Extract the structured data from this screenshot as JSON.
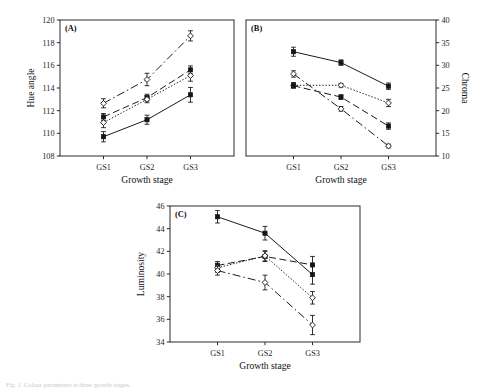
{
  "figure": {
    "caption": "Fig. 1. Colour parameters at three growth stages.",
    "panels": [
      "A",
      "B",
      "C"
    ]
  },
  "chart_data": [
    {
      "type": "line",
      "panel_tag": "(A)",
      "title": "",
      "xlabel": "Growth stage",
      "ylabel": "Hue angle",
      "ylabel_side": "left",
      "categories": [
        "GS1",
        "GS2",
        "GS3"
      ],
      "ylim": [
        108,
        120
      ],
      "yticks": [
        108,
        110,
        112,
        114,
        116,
        118,
        120
      ],
      "grid": false,
      "legend": "none",
      "series": [
        {
          "name": "S1",
          "marker": "filled-square",
          "linestyle": "solid",
          "values": [
            109.7,
            111.2,
            113.4
          ],
          "errors": [
            0.45,
            0.4,
            0.65
          ]
        },
        {
          "name": "S2",
          "marker": "filled-square",
          "linestyle": "dashed",
          "values": [
            111.45,
            113.15,
            115.6
          ],
          "errors": [
            0.3,
            0.3,
            0.35
          ]
        },
        {
          "name": "S3",
          "marker": "open-diamond",
          "linestyle": "dotted",
          "values": [
            110.95,
            113.0,
            115.1
          ],
          "errors": [
            0.45,
            0.3,
            0.5
          ]
        },
        {
          "name": "S4",
          "marker": "open-diamond",
          "linestyle": "dashdot",
          "values": [
            112.65,
            114.75,
            118.6
          ],
          "errors": [
            0.4,
            0.55,
            0.45
          ]
        }
      ]
    },
    {
      "type": "line",
      "panel_tag": "(B)",
      "title": "",
      "xlabel": "Growth stage",
      "ylabel": "Chroma",
      "ylabel_side": "right",
      "categories": [
        "GS1",
        "GS2",
        "GS3"
      ],
      "ylim": [
        10,
        40
      ],
      "yticks": [
        10,
        15,
        20,
        25,
        30,
        35,
        40
      ],
      "grid": false,
      "legend": "none",
      "series": [
        {
          "name": "S1",
          "marker": "filled-square",
          "linestyle": "solid",
          "values": [
            33.0,
            30.6,
            25.4
          ],
          "errors": [
            1.0,
            0.6,
            0.7
          ]
        },
        {
          "name": "S2",
          "marker": "open-diamond",
          "linestyle": "dotted",
          "values": [
            25.6,
            25.6,
            21.7
          ],
          "errors": [
            0.6,
            0.4,
            0.8
          ]
        },
        {
          "name": "S3",
          "marker": "filled-square",
          "linestyle": "dashed",
          "values": [
            25.5,
            23.0,
            16.6
          ],
          "errors": [
            0.5,
            0.5,
            0.7
          ]
        },
        {
          "name": "S4",
          "marker": "open-diamond",
          "linestyle": "dashdot",
          "values": [
            28.1,
            20.4,
            12.2
          ],
          "errors": [
            0.7,
            0.5,
            0.4
          ]
        }
      ]
    },
    {
      "type": "line",
      "panel_tag": "(C)",
      "title": "",
      "xlabel": "Growth stage",
      "ylabel": "Luminosity",
      "ylabel_side": "left",
      "categories": [
        "GS1",
        "GS2",
        "GS3"
      ],
      "ylim": [
        34,
        46
      ],
      "yticks": [
        34,
        36,
        38,
        40,
        42,
        44,
        46
      ],
      "grid": false,
      "legend": "none",
      "series": [
        {
          "name": "S1",
          "marker": "filled-square",
          "linestyle": "solid",
          "values": [
            45.05,
            43.6,
            39.95
          ],
          "errors": [
            0.55,
            0.6,
            0.85
          ]
        },
        {
          "name": "S2",
          "marker": "filled-square",
          "linestyle": "dashed",
          "values": [
            40.75,
            41.55,
            40.8
          ],
          "errors": [
            0.35,
            0.45,
            0.75
          ]
        },
        {
          "name": "S3",
          "marker": "open-diamond",
          "linestyle": "dotted",
          "values": [
            40.55,
            41.6,
            37.9
          ],
          "errors": [
            0.4,
            0.45,
            0.55
          ]
        },
        {
          "name": "S4",
          "marker": "open-diamond",
          "linestyle": "dashdot",
          "values": [
            40.3,
            39.25,
            35.5
          ],
          "errors": [
            0.4,
            0.65,
            0.85
          ]
        }
      ]
    }
  ]
}
